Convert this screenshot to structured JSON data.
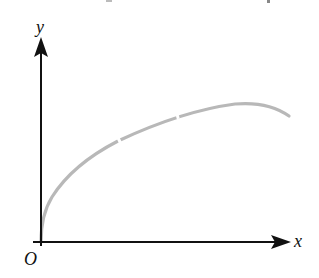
{
  "diagram": {
    "type": "function-graph",
    "axes": {
      "x_label": "x",
      "y_label": "y",
      "origin_label": "O",
      "axis_color": "#111111"
    },
    "curve": {
      "description": "increasing concave-down curve starting at origin, rising steeply then leveling off and slightly descending at right",
      "color": "#b5b5b5",
      "points_px": [
        [
          41,
          242
        ],
        [
          44,
          225
        ],
        [
          50,
          200
        ],
        [
          60,
          186
        ],
        [
          80,
          162
        ],
        [
          115,
          142
        ],
        [
          140,
          129
        ],
        [
          175,
          117
        ],
        [
          200,
          109
        ],
        [
          240,
          104
        ],
        [
          270,
          108
        ],
        [
          289,
          116
        ]
      ]
    }
  }
}
